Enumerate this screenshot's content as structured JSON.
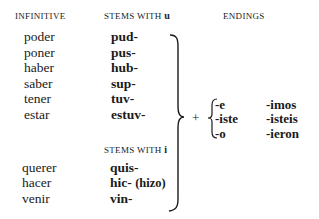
{
  "headers": {
    "infinitive": "INFINITIVE",
    "stems_u_prefix": "STEMS WITH ",
    "stems_u_letter": "u",
    "endings": "ENDINGS",
    "stems_i_prefix": "STEMS WITH ",
    "stems_i_letter": "i"
  },
  "group_u": [
    {
      "infinitive": "poder",
      "stem": "pud-"
    },
    {
      "infinitive": "poner",
      "stem": "pus-"
    },
    {
      "infinitive": "haber",
      "stem": "hub-"
    },
    {
      "infinitive": "saber",
      "stem": "sup-"
    },
    {
      "infinitive": "tener",
      "stem": "tuv-"
    },
    {
      "infinitive": "estar",
      "stem": "estuv-"
    }
  ],
  "group_i": [
    {
      "infinitive": "querer",
      "stem": "quis-",
      "note": ""
    },
    {
      "infinitive": "hacer",
      "stem": "hic-",
      "note": "(hizo)"
    },
    {
      "infinitive": "venir",
      "stem": "vin-",
      "note": ""
    }
  ],
  "operator": "+",
  "endings": {
    "singular": [
      "-e",
      "-iste",
      "-o"
    ],
    "plural": [
      "-imos",
      "-isteis",
      "-ieron"
    ]
  }
}
